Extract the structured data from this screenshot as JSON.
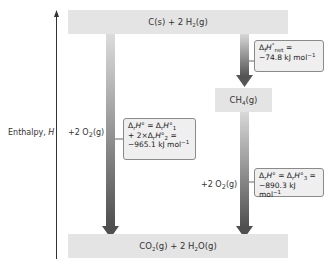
{
  "axis": {
    "label_text": "Enthalpy, ",
    "label_symbol": "H"
  },
  "levels": {
    "top": {
      "parts": [
        "C(s) + 2 H",
        "2",
        "(g)"
      ]
    },
    "middle": {
      "parts": [
        "CH",
        "4",
        "(g)"
      ]
    },
    "bottom": {
      "parts": [
        "CO",
        "2",
        "(g) + 2 H",
        "2",
        "O(g)"
      ]
    }
  },
  "reactant_labels": {
    "left": {
      "parts": [
        "+2 O",
        "2",
        "(g)"
      ]
    },
    "right": {
      "parts": [
        "+2 O",
        "2",
        "(g)"
      ]
    }
  },
  "callouts": {
    "net": {
      "line1_delta": "Δ",
      "line1_sub": "f",
      "line1_H": "H",
      "line1_sup": "°",
      "line1_subnet": "net",
      "line1_eq": " =",
      "line2": "−74.8 kJ mol",
      "line2_sup": "−1"
    },
    "left": {
      "line1": "ΔrH° = ΔrH°1",
      "line2": "+ 2×ΔrH°2 =",
      "line3": "−965.1 kJ mol",
      "line3_sup": "−1"
    },
    "right": {
      "line1": "ΔrH° = ΔrH°3 =",
      "line2": "−890.3 kJ mol",
      "line2_sup": "−1"
    }
  },
  "colors": {
    "level_fill": "#e4e4e4",
    "arrow_light": "#d8d8d8",
    "arrow_dark": "#555555",
    "callout_fill": "#efefef",
    "callout_border": "#8a8a8a"
  }
}
